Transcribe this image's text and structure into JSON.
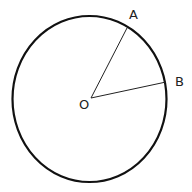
{
  "diagram": {
    "type": "circle-with-radii",
    "circle": {
      "cx": 90,
      "cy": 99,
      "rx": 77,
      "ry": 83,
      "stroke": "#111111"
    },
    "center": {
      "label": "O",
      "x": 91,
      "y": 98
    },
    "points": [
      {
        "label": "A",
        "x": 127,
        "y": 28
      },
      {
        "label": "B",
        "x": 166,
        "y": 82
      }
    ],
    "segments": [
      "OA",
      "OB"
    ]
  }
}
